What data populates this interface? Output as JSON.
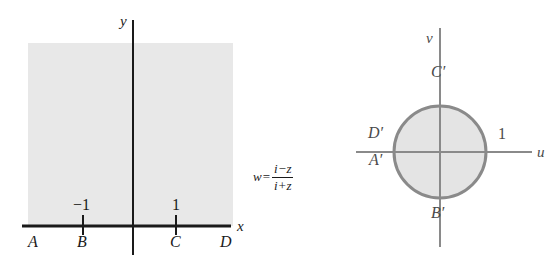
{
  "figure": {
    "type": "complex-mapping-diagram",
    "colors": {
      "region_fill": "#e8e8e8",
      "disk_fill": "#e4e4e4",
      "disk_stroke": "#8a8a8a",
      "axis_dark": "#1a1a1a",
      "axis_gray": "#8a8a8a",
      "text": "#1a1a1a"
    }
  },
  "z_plane": {
    "name": "z-plane",
    "axes": {
      "horizontal_label": "x",
      "vertical_label": "y"
    },
    "region": {
      "description": "shaded upper half-plane",
      "fill": "#e8e8e8"
    },
    "ticks": [
      {
        "label": "−1",
        "value": -1
      },
      {
        "label": "1",
        "value": 1
      }
    ],
    "points": [
      {
        "label": "A",
        "position": "far-left-on-x-axis"
      },
      {
        "label": "B",
        "position": "x = -1"
      },
      {
        "label": "C",
        "position": "x = 1"
      },
      {
        "label": "D",
        "position": "far-right-on-x-axis"
      }
    ]
  },
  "mapping": {
    "variable": "w",
    "equals": "=",
    "numerator": "i−z",
    "denominator": "i+z",
    "full": "w = (i−z)/(i+z)"
  },
  "w_plane": {
    "name": "w-plane",
    "axes": {
      "horizontal_label": "u",
      "vertical_label": "v"
    },
    "region": {
      "description": "shaded unit disk",
      "fill": "#e4e4e4",
      "stroke": "#8a8a8a"
    },
    "ticks": [
      {
        "label": "1",
        "value": 1
      }
    ],
    "points": [
      {
        "label": "C′",
        "position": "top of circle"
      },
      {
        "label": "D′",
        "position": "left of circle, above axis"
      },
      {
        "label": "A′",
        "position": "left of circle, below axis"
      },
      {
        "label": "B′",
        "position": "bottom of circle"
      }
    ]
  }
}
